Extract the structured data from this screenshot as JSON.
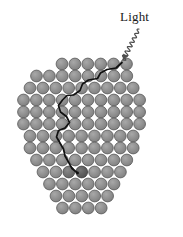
{
  "figure": {
    "width": 183,
    "height": 237,
    "background_color": "#ffffff",
    "caption_text": "Light"
  },
  "annotations": {
    "light_label": {
      "text": "Light",
      "x": 120,
      "y": 10,
      "font_size": 13,
      "color": "#1a1a1a"
    }
  },
  "colors": {
    "particle_fill": "#8c8c8c",
    "particle_stroke": "#5a5a5a",
    "particle_highlight": "#a6a6a6",
    "particle_dark_fill": "#6e6e6e",
    "particle_darkest_fill": "#5c5c5c",
    "path_stroke": "#111111",
    "arrow_stroke": "#4d4d4d",
    "background": "#ffffff"
  },
  "geometry": {
    "circle_radius": 5.9,
    "column_spacing": 12.9,
    "row_spacing": 12.2,
    "grid_origin_x": 21.5,
    "grid_origin_y": 64.0
  },
  "particle_rows": [
    {
      "row": 0,
      "count": 6,
      "start_x": 62.0,
      "y": 64.0
    },
    {
      "row": 1,
      "count": 8,
      "start_x": 36.5,
      "y": 76.0
    },
    {
      "row": 2,
      "count": 9,
      "start_x": 30.0,
      "y": 88.0
    },
    {
      "row": 3,
      "count": 10,
      "start_x": 23.5,
      "y": 100.0
    },
    {
      "row": 4,
      "count": 10,
      "start_x": 23.5,
      "y": 112.0
    },
    {
      "row": 5,
      "count": 10,
      "start_x": 23.5,
      "y": 124.0
    },
    {
      "row": 6,
      "count": 9,
      "start_x": 30.0,
      "y": 136.0
    },
    {
      "row": 7,
      "count": 9,
      "start_x": 30.0,
      "y": 148.0
    },
    {
      "row": 8,
      "count": 8,
      "start_x": 36.5,
      "y": 160.0
    },
    {
      "row": 9,
      "count": 7,
      "start_x": 43.0,
      "y": 172.0
    },
    {
      "row": 10,
      "count": 6,
      "start_x": 49.5,
      "y": 184.0
    },
    {
      "row": 11,
      "count": 5,
      "start_x": 56.0,
      "y": 196.0
    },
    {
      "row": 12,
      "count": 4,
      "start_x": 62.5,
      "y": 208.0
    }
  ],
  "highlighted_particles": [
    {
      "row": 9,
      "index": 2,
      "shade": "dark"
    },
    {
      "row": 9,
      "index": 3,
      "shade": "darkest"
    }
  ],
  "scatter_path": {
    "stroke_width": 1.7,
    "points": [
      [
        122.0,
        62.5
      ],
      [
        116.0,
        68.0
      ],
      [
        107.0,
        69.5
      ],
      [
        100.5,
        73.0
      ],
      [
        97.5,
        78.5
      ],
      [
        88.5,
        80.0
      ],
      [
        82.5,
        84.0
      ],
      [
        80.0,
        90.5
      ],
      [
        73.5,
        95.0
      ],
      [
        67.0,
        95.5
      ],
      [
        62.5,
        100.0
      ],
      [
        58.5,
        105.5
      ],
      [
        60.5,
        112.0
      ],
      [
        66.5,
        116.5
      ],
      [
        69.5,
        122.5
      ],
      [
        65.0,
        128.0
      ],
      [
        58.5,
        130.5
      ],
      [
        56.5,
        137.0
      ],
      [
        60.0,
        143.0
      ],
      [
        63.5,
        149.0
      ],
      [
        65.0,
        156.0
      ],
      [
        68.5,
        162.0
      ],
      [
        72.0,
        168.5
      ],
      [
        77.5,
        173.0
      ]
    ]
  },
  "incoming_ray": {
    "type": "wavy-arrow",
    "stroke_width": 1.2,
    "start": [
      139.0,
      29.0
    ],
    "end": [
      123.0,
      60.0
    ],
    "wave_amplitude": 2.6,
    "wave_count": 7,
    "arrowhead_size": 5.5
  }
}
